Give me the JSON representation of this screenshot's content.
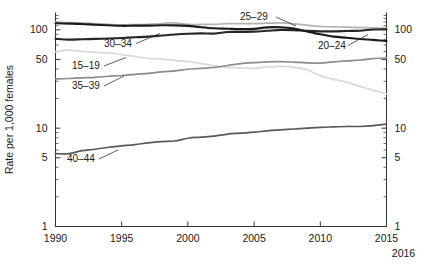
{
  "chart_data": {
    "type": "line",
    "title": "",
    "subtitle": "",
    "xlabel": "",
    "ylabel": "Rate per 1,000 females",
    "y_scale": "log",
    "ylim": [
      1,
      150
    ],
    "xlim": [
      1990,
      2015
    ],
    "y_ticks": [
      1,
      5,
      10,
      50,
      100
    ],
    "y_tick_labels": [
      "1",
      "5",
      "10",
      "50",
      "100"
    ],
    "y_minor_ticks": [
      2,
      3,
      4,
      6,
      7,
      8,
      9,
      20,
      30,
      40,
      60,
      70,
      80,
      90
    ],
    "x_ticks": [
      1990,
      1995,
      2000,
      2005,
      2010,
      2015
    ],
    "x_tick_labels": [
      "1990",
      "1995",
      "2000",
      "2005",
      "2010",
      "2015"
    ],
    "x_extra_label": "2016",
    "grid": false,
    "legend_position": "inline-annotations",
    "right_axis": true,
    "right_axis_tick_labels": [
      "100",
      "50",
      "10",
      "5",
      "1"
    ],
    "x": [
      1990,
      1991,
      1992,
      1993,
      1994,
      1995,
      1996,
      1997,
      1998,
      1999,
      2000,
      2001,
      2002,
      2003,
      2004,
      2005,
      2006,
      2007,
      2008,
      2009,
      2010,
      2011,
      2012,
      2013,
      2014,
      2015
    ],
    "series": [
      {
        "name": "15-19",
        "label": "15–19",
        "color": "#d9d9d9",
        "values": [
          59.9,
          62.1,
          60.3,
          59.0,
          58.2,
          56.0,
          53.5,
          51.3,
          50.3,
          48.8,
          47.7,
          45.3,
          43.0,
          41.6,
          41.1,
          40.5,
          41.9,
          42.5,
          41.5,
          39.1,
          34.2,
          31.3,
          29.4,
          26.5,
          24.2,
          22.3
        ]
      },
      {
        "name": "20-24",
        "label": "20–24",
        "color": "#1a1a1a",
        "values": [
          116.5,
          115.7,
          114.6,
          112.6,
          111.1,
          109.8,
          110.4,
          110.4,
          111.2,
          111.0,
          109.7,
          106.2,
          103.6,
          102.6,
          101.7,
          102.2,
          105.9,
          106.3,
          103.0,
          96.3,
          90.0,
          85.3,
          83.1,
          80.7,
          79.0,
          76.8
        ]
      },
      {
        "name": "25-29",
        "label": "25–29",
        "color": "#b3b3b3",
        "values": [
          120.2,
          118.2,
          117.4,
          115.5,
          113.9,
          112.2,
          113.1,
          113.8,
          115.9,
          117.8,
          113.5,
          113.4,
          113.6,
          115.6,
          115.5,
          115.5,
          116.8,
          117.5,
          115.1,
          111.5,
          108.3,
          107.2,
          106.5,
          105.5,
          104.5,
          104.3
        ]
      },
      {
        "name": "30-34",
        "label": "30–34",
        "color": "#262626",
        "values": [
          80.8,
          79.5,
          80.2,
          80.8,
          81.5,
          82.5,
          83.9,
          85.3,
          87.4,
          89.6,
          91.2,
          91.9,
          91.5,
          95.1,
          95.3,
          95.8,
          97.7,
          99.9,
          99.3,
          97.5,
          96.5,
          96.5,
          97.3,
          98.0,
          100.8,
          101.5
        ]
      },
      {
        "name": "35-39",
        "label": "35–39",
        "color": "#8c8c8c",
        "values": [
          31.7,
          32.0,
          32.5,
          32.9,
          33.7,
          34.3,
          35.3,
          36.1,
          37.4,
          38.3,
          39.7,
          40.6,
          41.4,
          43.4,
          45.4,
          46.3,
          47.3,
          47.5,
          46.9,
          46.1,
          45.9,
          47.2,
          48.3,
          49.3,
          51.0,
          51.8
        ]
      },
      {
        "name": "40-44",
        "label": "40–44",
        "color": "#595959",
        "values": [
          5.5,
          5.5,
          5.9,
          6.1,
          6.4,
          6.6,
          6.8,
          7.1,
          7.3,
          7.4,
          7.9,
          8.1,
          8.3,
          8.7,
          8.9,
          9.1,
          9.4,
          9.6,
          9.8,
          10.0,
          10.2,
          10.3,
          10.4,
          10.4,
          10.6,
          11.0
        ]
      }
    ],
    "annotations": [
      {
        "text": "15–19",
        "series": "15-19",
        "x": 72,
        "y": 69
      },
      {
        "text": "20–24",
        "series": "20-24",
        "x": 318,
        "y": 49
      },
      {
        "text": "25–29",
        "series": "25-29",
        "x": 240,
        "y": 20
      },
      {
        "text": "30–34",
        "series": "30-34",
        "x": 104,
        "y": 47
      },
      {
        "text": "35–39",
        "series": "35-39",
        "x": 72,
        "y": 89
      },
      {
        "text": "40–44",
        "series": "40-44",
        "x": 67,
        "y": 162
      }
    ]
  }
}
